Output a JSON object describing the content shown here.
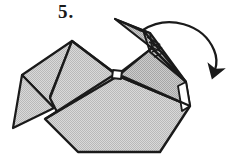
{
  "diagram": {
    "step_label": "5.",
    "background_color": "#ffffff",
    "line_color": "#1a1a1a",
    "paper_fill": "#c8c8c8",
    "paper_fill_light": "#d2d2d2",
    "paper_fill_dark": "#b4b4b4",
    "arrow": {
      "kind": "fold-over-curved-arrow",
      "direction": "clockwise-down-right",
      "start": [
        143,
        30
      ],
      "end": [
        215,
        74
      ],
      "label": ""
    },
    "parts": [
      {
        "name": "left-wing",
        "label": ""
      },
      {
        "name": "left-wing-under-flap",
        "label": ""
      },
      {
        "name": "body",
        "label": ""
      },
      {
        "name": "body-left-panel",
        "label": ""
      },
      {
        "name": "neck-and-head",
        "label": ""
      },
      {
        "name": "beak",
        "label": ""
      },
      {
        "name": "head-inner-flap",
        "label": ""
      },
      {
        "name": "center-knot",
        "label": ""
      }
    ]
  }
}
